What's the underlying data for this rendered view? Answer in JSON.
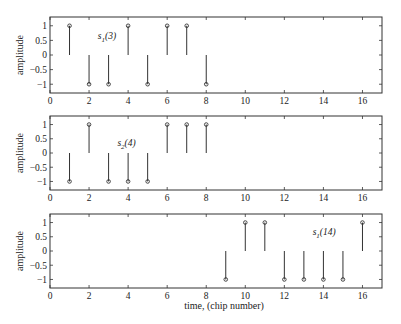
{
  "chart_data": [
    {
      "type": "stem",
      "title": "",
      "ylabel": "amplitude",
      "xlabel": "",
      "xlim": [
        0,
        17
      ],
      "ylim": [
        -1.3,
        1.3
      ],
      "xticks": [
        0,
        2,
        4,
        6,
        8,
        10,
        12,
        14,
        16
      ],
      "yticks": [
        1,
        0.5,
        0,
        -0.5,
        -1
      ],
      "ytick_labels": [
        "1",
        "0.5",
        "0",
        "-0.5",
        "-1"
      ],
      "x": [
        1,
        2,
        3,
        4,
        5,
        6,
        7,
        8
      ],
      "values": [
        1,
        -1,
        -1,
        1,
        -1,
        1,
        1,
        -1
      ],
      "annotation": {
        "text": "s",
        "sub": "1",
        "suffix": "(3)",
        "x": 2.45,
        "y": 0.55
      }
    },
    {
      "type": "stem",
      "title": "",
      "ylabel": "amplitude",
      "xlabel": "",
      "xlim": [
        0,
        17
      ],
      "ylim": [
        -1.3,
        1.3
      ],
      "xticks": [
        0,
        2,
        4,
        6,
        8,
        10,
        12,
        14,
        16
      ],
      "yticks": [
        1,
        0.5,
        0,
        -0.5,
        -1
      ],
      "ytick_labels": [
        "1",
        "0.5",
        "0",
        "-0.5",
        "-1"
      ],
      "x": [
        1,
        2,
        3,
        4,
        5,
        6,
        7,
        8
      ],
      "values": [
        -1,
        1,
        -1,
        -1,
        -1,
        1,
        1,
        1
      ],
      "annotation": {
        "text": "s",
        "sub": "2",
        "suffix": "(4)",
        "x": 3.45,
        "y": 0.25
      }
    },
    {
      "type": "stem",
      "title": "",
      "ylabel": "amplitude",
      "xlabel": "time, (chip number)",
      "xlim": [
        0,
        17
      ],
      "ylim": [
        -1.3,
        1.3
      ],
      "xticks": [
        0,
        2,
        4,
        6,
        8,
        10,
        12,
        14,
        16
      ],
      "yticks": [
        1,
        0.5,
        0,
        -0.5,
        -1
      ],
      "ytick_labels": [
        "1",
        "0.5",
        "0",
        "-0.5",
        "-1"
      ],
      "x": [
        9,
        10,
        11,
        12,
        13,
        14,
        15,
        16
      ],
      "values": [
        -1,
        1,
        1,
        -1,
        -1,
        -1,
        -1,
        1
      ],
      "annotation": {
        "text": "s",
        "sub": "1",
        "suffix": "(14)",
        "x": 13.45,
        "y": 0.55
      }
    }
  ],
  "colors": {
    "stem": "#333333",
    "axis": "#333333",
    "text": "#222222"
  }
}
